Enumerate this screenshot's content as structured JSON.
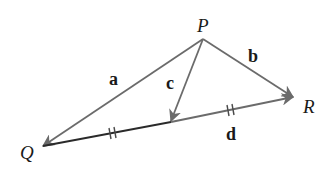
{
  "diagram": {
    "type": "vector-triangle",
    "colors": {
      "background": "#ffffff",
      "vector_stroke": "#6b6b6b",
      "base_stroke": "#2a2a2a",
      "label": "#1a1a1a"
    },
    "points": {
      "P": {
        "label": "P",
        "x": 203,
        "y": 39
      },
      "Q": {
        "label": "Q",
        "x": 43,
        "y": 146
      },
      "R": {
        "label": "R",
        "x": 293,
        "y": 97
      },
      "M": {
        "label": "",
        "x": 171,
        "y": 122
      }
    },
    "vectors": [
      {
        "name": "a",
        "label": "a",
        "from": "P",
        "to": "Q"
      },
      {
        "name": "b",
        "label": "b",
        "from": "P",
        "to": "R"
      },
      {
        "name": "c",
        "label": "c",
        "from": "P",
        "to": "M"
      },
      {
        "name": "d",
        "label": "d",
        "from": "Q",
        "to": "R"
      }
    ],
    "tick_marks": [
      {
        "segment": "QM",
        "count": 2
      },
      {
        "segment": "MR",
        "count": 2
      }
    ],
    "labels": {
      "P": "P",
      "Q": "Q",
      "R": "R",
      "a": "a",
      "b": "b",
      "c": "c",
      "d": "d"
    }
  }
}
